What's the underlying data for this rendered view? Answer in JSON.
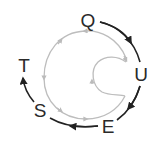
{
  "diagram": {
    "letters": [
      {
        "id": "q",
        "text": "Q",
        "x": 88,
        "y": 20
      },
      {
        "id": "u",
        "text": "U",
        "x": 141,
        "y": 74
      },
      {
        "id": "e",
        "text": "E",
        "x": 108,
        "y": 126
      },
      {
        "id": "s",
        "text": "S",
        "x": 40,
        "y": 110
      },
      {
        "id": "t",
        "text": "T",
        "x": 24,
        "y": 65
      }
    ],
    "sequence": [
      "Q",
      "U",
      "E",
      "S",
      "T"
    ],
    "colors": {
      "arrow": "#222222",
      "spiral": "#b8b8b8",
      "text": "#2a2a2a"
    }
  }
}
